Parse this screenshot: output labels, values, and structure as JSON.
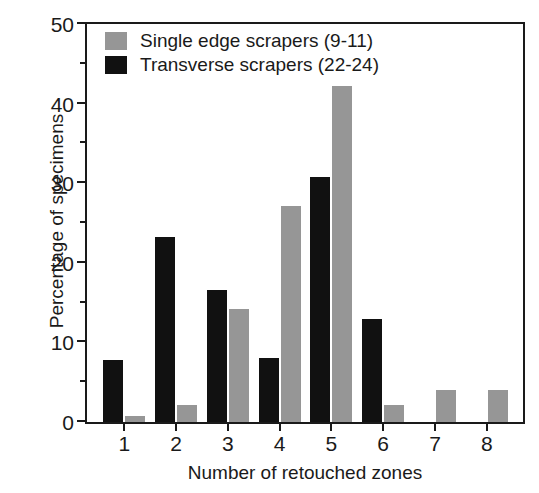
{
  "chart_data": {
    "type": "bar",
    "title": "",
    "xlabel": "Number of retouched zones",
    "ylabel": "Percentage of specimens",
    "categories": [
      "1",
      "2",
      "3",
      "4",
      "5",
      "6",
      "7",
      "8"
    ],
    "series": [
      {
        "name": "Single edge scrapers (9-11)",
        "color": "#969696",
        "values": [
          0.8,
          2.1,
          14.2,
          27.2,
          42.2,
          2.1,
          4.0,
          4.0
        ]
      },
      {
        "name": "Transverse scrapers (22-24)",
        "color": "#111111",
        "values": [
          7.8,
          23.3,
          16.6,
          8.0,
          30.8,
          12.9,
          0,
          0
        ]
      }
    ],
    "ylim": [
      0,
      50
    ],
    "yticks_major": [
      0,
      10,
      20,
      30,
      40,
      50
    ],
    "yticks_minor": [
      5,
      15,
      25,
      35,
      45
    ],
    "ytick_labels": [
      "0",
      "10",
      "20",
      "30",
      "40",
      "50"
    ],
    "grid": false,
    "legend_position": "top-left"
  },
  "legend": {
    "entries": [
      {
        "label": "Single edge scrapers (9-11)",
        "color": "#969696"
      },
      {
        "label": "Transverse scrapers (22-24)",
        "color": "#111111"
      }
    ]
  },
  "axes": {
    "y_title": "Percentage of specimens",
    "x_title": "Number of retouched zones"
  }
}
